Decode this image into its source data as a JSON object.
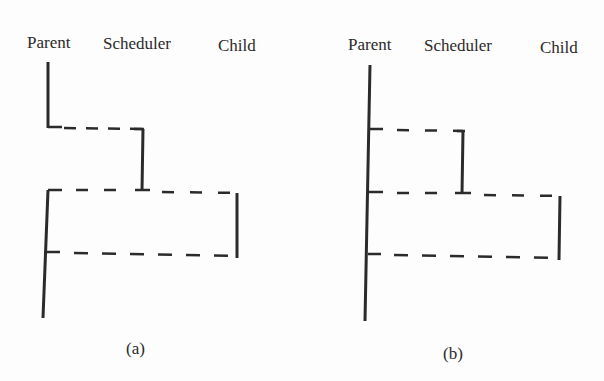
{
  "panels": [
    {
      "id": "a",
      "caption": "(a)",
      "columns": {
        "parent": "Parent",
        "scheduler": "Scheduler",
        "child": "Child"
      }
    },
    {
      "id": "b",
      "caption": "(b)",
      "columns": {
        "parent": "Parent",
        "scheduler": "Scheduler",
        "child": "Child"
      }
    }
  ],
  "style": {
    "line_color": "#2b2b2b",
    "background": "#fdfdfd"
  }
}
